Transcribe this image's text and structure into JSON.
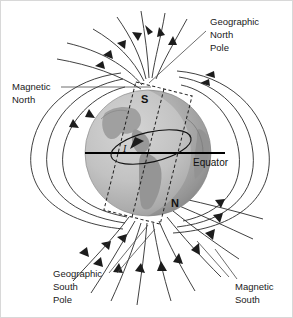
{
  "figure": {
    "background_color": "#ffffff",
    "border_color": "#d8d8d8"
  },
  "labels": {
    "geographic_north": {
      "line1": "Geographic",
      "line2": "North",
      "line3": "Pole"
    },
    "magnetic_north": {
      "line1": "Magnetic",
      "line2": "North"
    },
    "geographic_south": {
      "line1": "Geographic",
      "line2": "South",
      "line3": "Pole"
    },
    "magnetic_south": {
      "line1": "Magnetic",
      "line2": "South"
    },
    "equator": "Equator",
    "magnet_south_pole": "S",
    "magnet_north_pole": "N",
    "current": "I"
  },
  "colors": {
    "globe_light": "#c9c9c9",
    "globe_mid": "#b4b4b4",
    "globe_shadow": "#9a9a9a",
    "continent": "#9b9b9b",
    "field_line": "#2b2b2b",
    "equator_line": "#000000",
    "text": "#1a1a1a",
    "leader_line": "#4a4a4a"
  },
  "geometry": {
    "globe_center_x": 147,
    "globe_center_y": 152,
    "globe_radius": 63,
    "magnet_tilt_degrees": 14,
    "equator_y": 152
  }
}
